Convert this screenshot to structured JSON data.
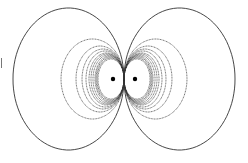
{
  "diagram": {
    "type": "dipole field lines",
    "center": [
      124,
      79
    ],
    "charges": [
      {
        "x": 113,
        "y": 79
      },
      {
        "x": 135,
        "y": 79
      }
    ],
    "loops": [
      {
        "rx": 111,
        "ry": 71
      },
      {
        "rx": 63,
        "ry": 40
      },
      {
        "rx": 48,
        "ry": 33
      },
      {
        "rx": 42,
        "ry": 30
      },
      {
        "rx": 38,
        "ry": 28
      },
      {
        "rx": 35,
        "ry": 26
      },
      {
        "rx": 33,
        "ry": 25
      },
      {
        "rx": 31,
        "ry": 24
      },
      {
        "rx": 29,
        "ry": 23
      },
      {
        "rx": 28,
        "ry": 22
      },
      {
        "rx": 27,
        "ry": 21
      },
      {
        "rx": 26,
        "ry": 20
      }
    ],
    "line_color": "#333333",
    "dot_color": "#000000"
  }
}
